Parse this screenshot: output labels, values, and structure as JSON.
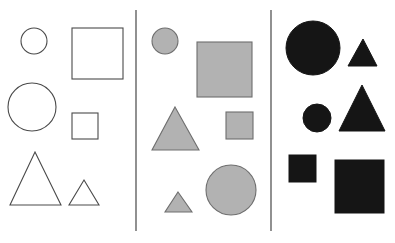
{
  "figure": {
    "width": 395,
    "height": 243,
    "background_color": "#ffffff"
  },
  "colors": {
    "outline_fill": "#ffffff",
    "outline_stroke": "#4a4a4a",
    "gray_fill": "#b2b2b2",
    "gray_stroke": "#6e6e6e",
    "black_fill": "#151515",
    "divider_stroke": "#555555"
  },
  "dividers": [
    {
      "name": "divider-1",
      "x": 136,
      "y1": 10,
      "y2": 231
    },
    {
      "name": "divider-2",
      "x": 271,
      "y1": 10,
      "y2": 231
    }
  ],
  "panels": [
    {
      "id": "panel-outline",
      "label": "Panel 1",
      "fill_style": "outline",
      "shape_count": 6,
      "shapes": [
        {
          "name": "small-circle",
          "type": "circle",
          "size": "small",
          "cx": 34,
          "cy": 41,
          "r": 13
        },
        {
          "name": "large-square",
          "type": "square",
          "size": "large",
          "x": 72,
          "y": 28,
          "w": 51,
          "h": 51
        },
        {
          "name": "large-circle",
          "type": "circle",
          "size": "large",
          "cx": 32,
          "cy": 107,
          "r": 24
        },
        {
          "name": "small-square",
          "type": "square",
          "size": "small",
          "x": 72,
          "y": 113,
          "w": 26,
          "h": 26
        },
        {
          "name": "large-triangle",
          "type": "triangle",
          "size": "large",
          "points": "35,152 61,205 10,205"
        },
        {
          "name": "small-triangle",
          "type": "triangle",
          "size": "small",
          "points": "84,180 99,205 69,205"
        }
      ]
    },
    {
      "id": "panel-gray",
      "label": "Panel 2",
      "fill_style": "gray",
      "shape_count": 6,
      "shapes": [
        {
          "name": "small-circle",
          "type": "circle",
          "size": "small",
          "cx": 165,
          "cy": 41,
          "r": 13
        },
        {
          "name": "large-square",
          "type": "square",
          "size": "large",
          "x": 197,
          "y": 42,
          "w": 55,
          "h": 55
        },
        {
          "name": "large-triangle",
          "type": "triangle",
          "size": "large",
          "points": "175,107 199,150 152,150"
        },
        {
          "name": "small-square",
          "type": "square",
          "size": "small",
          "x": 226,
          "y": 112,
          "w": 27,
          "h": 27
        },
        {
          "name": "large-circle",
          "type": "circle",
          "size": "large",
          "cx": 231,
          "cy": 190,
          "r": 25
        },
        {
          "name": "small-triangle",
          "type": "triangle",
          "size": "small",
          "points": "178,192 192,212 165,212"
        }
      ]
    },
    {
      "id": "panel-black",
      "label": "Panel 3",
      "fill_style": "black",
      "shape_count": 6,
      "shapes": [
        {
          "name": "large-circle",
          "type": "circle",
          "size": "large",
          "cx": 313,
          "cy": 48,
          "r": 27
        },
        {
          "name": "small-triangle",
          "type": "triangle",
          "size": "small",
          "points": "363,39 377,66 348,66"
        },
        {
          "name": "small-circle",
          "type": "circle",
          "size": "small",
          "cx": 317,
          "cy": 118,
          "r": 14
        },
        {
          "name": "large-triangle",
          "type": "triangle",
          "size": "large",
          "points": "362,85 385,131 339,131"
        },
        {
          "name": "small-square",
          "type": "square",
          "size": "small",
          "x": 289,
          "y": 155,
          "w": 27,
          "h": 27
        },
        {
          "name": "large-square",
          "type": "square",
          "size": "large",
          "x": 335,
          "y": 160,
          "w": 49,
          "h": 53
        }
      ]
    }
  ]
}
